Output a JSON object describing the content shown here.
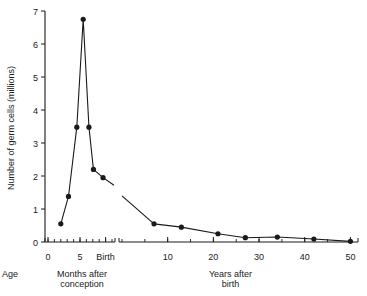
{
  "chart_data": {
    "type": "line",
    "title": "",
    "subtitle": "",
    "ylabel": "Number of germ cells (millions)",
    "xlabel": "Age",
    "ylim": [
      0,
      7
    ],
    "y_ticks": [
      0,
      1,
      2,
      3,
      4,
      5,
      6,
      7
    ],
    "grid": false,
    "legend": null,
    "broken_axis": true,
    "panels": [
      {
        "name": "prenatal",
        "xlabel": "Months after conception",
        "xlabel_line1": "Months after",
        "xlabel_line2": "conception",
        "xlim": [
          0,
          10
        ],
        "x_ticks": [
          {
            "value": 0,
            "label": "0"
          },
          {
            "value": 5,
            "label": "5"
          },
          {
            "value": 9,
            "label": "Birth"
          }
        ],
        "x_minor_ticks": [
          0,
          1,
          2,
          3,
          4,
          5,
          6,
          7,
          8,
          9,
          10
        ],
        "points": [
          {
            "x": 2.0,
            "y": 0.55
          },
          {
            "x": 3.2,
            "y": 1.38
          },
          {
            "x": 4.5,
            "y": 3.48
          },
          {
            "x": 5.5,
            "y": 6.75
          },
          {
            "x": 6.4,
            "y": 3.48
          },
          {
            "x": 7.1,
            "y": 2.2
          },
          {
            "x": 8.6,
            "y": 1.95
          }
        ],
        "line_end_y": 1.72
      },
      {
        "name": "postnatal",
        "xlabel": "Years after birth",
        "xlabel_line1": "Years after",
        "xlabel_line2": "birth",
        "xlim": [
          0,
          51
        ],
        "x_ticks": [
          {
            "value": 10,
            "label": "10"
          },
          {
            "value": 20,
            "label": "20"
          },
          {
            "value": 30,
            "label": "30"
          },
          {
            "value": 40,
            "label": "40"
          },
          {
            "value": 50,
            "label": "50"
          }
        ],
        "x_minor_ticks": [
          0,
          5,
          10,
          15,
          20,
          25,
          30,
          35,
          40,
          45,
          50
        ],
        "line_start_y": 1.4,
        "points": [
          {
            "x": 7.0,
            "y": 0.55
          },
          {
            "x": 13.0,
            "y": 0.45
          },
          {
            "x": 21.0,
            "y": 0.25
          },
          {
            "x": 27.0,
            "y": 0.13
          },
          {
            "x": 34.0,
            "y": 0.15
          },
          {
            "x": 42.0,
            "y": 0.09
          },
          {
            "x": 50.0,
            "y": 0.02
          }
        ]
      }
    ],
    "colors": {
      "line": "#1a1a1a",
      "marker": "#1a1a1a",
      "axis": "#1a1a1a",
      "background": "#ffffff"
    }
  }
}
